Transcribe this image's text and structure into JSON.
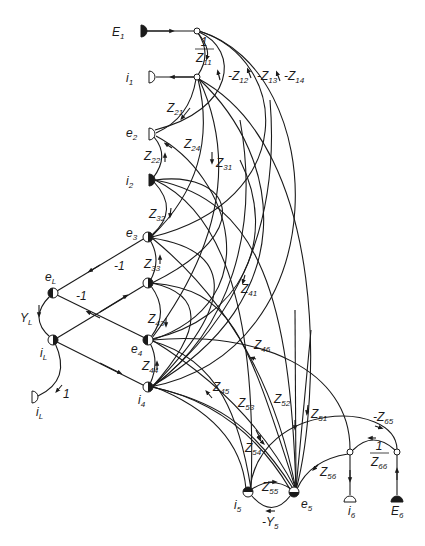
{
  "diagram": {
    "type": "signal-flow-graph",
    "nodes": [
      {
        "id": "E1",
        "label": "E",
        "sub": "1",
        "x": 144,
        "y": 31,
        "kind": "source-filled",
        "lx": 112,
        "ly": 36
      },
      {
        "id": "j1",
        "label": "",
        "sub": "",
        "x": 197,
        "y": 31,
        "kind": "junction",
        "lx": 0,
        "ly": 0
      },
      {
        "id": "i1",
        "label": "i",
        "sub": "1",
        "x": 152,
        "y": 77,
        "kind": "sink-open",
        "lx": 126,
        "ly": 82
      },
      {
        "id": "j2",
        "label": "",
        "sub": "",
        "x": 197,
        "y": 77,
        "kind": "junction",
        "lx": 0,
        "ly": 0
      },
      {
        "id": "e2",
        "label": "e",
        "sub": "2",
        "x": 152,
        "y": 134,
        "kind": "sink-open",
        "lx": 126,
        "ly": 137
      },
      {
        "id": "i2",
        "label": "i",
        "sub": "2",
        "x": 152,
        "y": 180,
        "kind": "source-filled",
        "lx": 126,
        "ly": 185
      },
      {
        "id": "e3",
        "label": "e",
        "sub": "3",
        "x": 148,
        "y": 237,
        "kind": "half-right",
        "lx": 126,
        "ly": 237
      },
      {
        "id": "eL",
        "label": "e",
        "sub": "L",
        "x": 53,
        "y": 293,
        "kind": "half-left",
        "lx": 45,
        "ly": 281
      },
      {
        "id": "n3b",
        "label": "",
        "sub": "",
        "x": 148,
        "y": 283,
        "kind": "half-right",
        "lx": 0,
        "ly": 0
      },
      {
        "id": "iL",
        "label": "i",
        "sub": "L",
        "x": 53,
        "y": 340,
        "kind": "half-right-open",
        "lx": 40,
        "ly": 357
      },
      {
        "id": "e4",
        "label": "e",
        "sub": "4",
        "x": 148,
        "y": 340,
        "kind": "half-left",
        "lx": 131,
        "ly": 353
      },
      {
        "id": "i4",
        "label": "i",
        "sub": "4",
        "x": 148,
        "y": 387,
        "kind": "half-right",
        "lx": 138,
        "ly": 404
      },
      {
        "id": "iLout",
        "label": "i",
        "sub": "L",
        "x": 35,
        "y": 397,
        "kind": "sink-open",
        "lx": 36,
        "ly": 416
      },
      {
        "id": "i5",
        "label": "i",
        "sub": "5",
        "x": 248,
        "y": 492,
        "kind": "half-top",
        "lx": 234,
        "ly": 509
      },
      {
        "id": "e5",
        "label": "e",
        "sub": "5",
        "x": 294,
        "y": 492,
        "kind": "half-bottom",
        "lx": 301,
        "ly": 508
      },
      {
        "id": "j6",
        "label": "",
        "sub": "",
        "x": 350,
        "y": 452,
        "kind": "junction",
        "lx": 0,
        "ly": 0
      },
      {
        "id": "i6",
        "label": "i",
        "sub": "6",
        "x": 350,
        "y": 499,
        "kind": "sink-open",
        "lx": 348,
        "ly": 515
      },
      {
        "id": "j7",
        "label": "",
        "sub": "",
        "x": 397,
        "y": 452,
        "kind": "junction",
        "lx": 0,
        "ly": 0
      },
      {
        "id": "E6",
        "label": "E",
        "sub": "6",
        "x": 397,
        "y": 499,
        "kind": "source-filled",
        "lx": 391,
        "ly": 515
      }
    ],
    "edge_labels": [
      {
        "text": "1",
        "sub": "",
        "frac": "Z",
        "fracsub": "11",
        "x": 198,
        "y": 52,
        "kind": "fraction"
      },
      {
        "text": "-Z",
        "sub": "12",
        "x": 228,
        "y": 80
      },
      {
        "text": "-Z",
        "sub": "13",
        "x": 257,
        "y": 80
      },
      {
        "text": "-Z",
        "sub": "14",
        "x": 284,
        "y": 80
      },
      {
        "text": "Z",
        "sub": "21",
        "x": 167,
        "y": 112
      },
      {
        "text": "Z",
        "sub": "24",
        "x": 184,
        "y": 148
      },
      {
        "text": "Z",
        "sub": "22",
        "x": 144,
        "y": 160
      },
      {
        "text": "Z",
        "sub": "31",
        "x": 216,
        "y": 167
      },
      {
        "text": "Z",
        "sub": "32",
        "x": 149,
        "y": 218
      },
      {
        "text": "Z",
        "sub": "33",
        "x": 144,
        "y": 268
      },
      {
        "text": "-1",
        "sub": "",
        "x": 114,
        "y": 270
      },
      {
        "text": "-1",
        "sub": "",
        "x": 76,
        "y": 300
      },
      {
        "text": "Y",
        "sub": "L",
        "x": 20,
        "y": 322
      },
      {
        "text": "Z",
        "sub": "43",
        "x": 148,
        "y": 323
      },
      {
        "text": "Z",
        "sub": "41",
        "x": 241,
        "y": 293
      },
      {
        "text": "Z",
        "sub": "46",
        "x": 254,
        "y": 349
      },
      {
        "text": "Z",
        "sub": "44",
        "x": 142,
        "y": 370
      },
      {
        "text": "1",
        "sub": "",
        "x": 63,
        "y": 398
      },
      {
        "text": "Z",
        "sub": "45",
        "x": 213,
        "y": 391
      },
      {
        "text": "Z",
        "sub": "53",
        "x": 238,
        "y": 407
      },
      {
        "text": "Z",
        "sub": "52",
        "x": 274,
        "y": 403
      },
      {
        "text": "Z",
        "sub": "51",
        "x": 311,
        "y": 418
      },
      {
        "text": "-Z",
        "sub": "65",
        "x": 373,
        "y": 421
      },
      {
        "text": "Z",
        "sub": "54",
        "x": 245,
        "y": 452
      },
      {
        "text": "1",
        "sub": "",
        "frac": "Z",
        "fracsub": "66",
        "x": 373,
        "y": 456,
        "kind": "fraction"
      },
      {
        "text": "Z",
        "sub": "56",
        "x": 320,
        "y": 476
      },
      {
        "text": "Z",
        "sub": "55",
        "x": 262,
        "y": 491
      },
      {
        "text": "-Y",
        "sub": "5",
        "x": 262,
        "y": 526
      }
    ]
  }
}
